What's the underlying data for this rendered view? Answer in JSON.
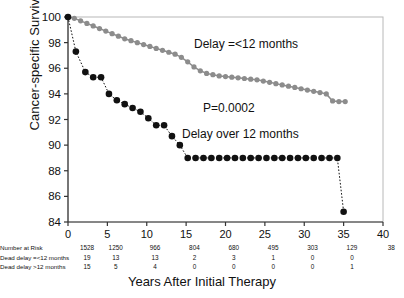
{
  "chart_data": {
    "type": "line",
    "title": "",
    "xlabel": "Years After Initial Therapy",
    "ylabel": "Cancer-specific Survival (%)",
    "xlim": [
      0,
      40
    ],
    "ylim": [
      84,
      100
    ],
    "xticks": [
      0,
      5,
      10,
      15,
      20,
      25,
      30,
      35,
      40
    ],
    "yticks": [
      84,
      86,
      88,
      90,
      92,
      94,
      96,
      98,
      100
    ],
    "grid": false,
    "legend_position": "inline-annotations",
    "annotations": [
      {
        "text": "Delay =<12 months",
        "x": 21.5,
        "y": 98.3
      },
      {
        "text": "P=0.0002",
        "x": 23.0,
        "y": 93.3
      },
      {
        "text": "Delay over 12 months",
        "x": 20.5,
        "y": 91.2
      }
    ],
    "series": [
      {
        "name": "Delay =<12 months",
        "color": "#8c8c8c",
        "marker": "circle",
        "x": [
          0.0,
          0.8,
          1.6,
          2.4,
          3.2,
          4.0,
          4.8,
          5.6,
          6.4,
          7.2,
          8.0,
          8.8,
          9.6,
          10.4,
          11.2,
          12.0,
          12.8,
          13.6,
          14.4,
          15.2,
          16.0,
          16.8,
          17.6,
          18.4,
          19.2,
          20.0,
          20.8,
          21.6,
          22.4,
          23.2,
          24.0,
          24.8,
          25.6,
          26.4,
          27.2,
          28.0,
          28.8,
          29.6,
          30.4,
          31.2,
          32.0,
          32.8,
          33.6,
          34.4,
          35.2
        ],
        "y": [
          100.0,
          99.9,
          99.7,
          99.5,
          99.3,
          99.1,
          98.9,
          98.7,
          98.5,
          98.3,
          98.15,
          98.0,
          97.85,
          97.7,
          97.55,
          97.4,
          97.25,
          97.1,
          96.85,
          96.5,
          96.1,
          95.8,
          95.6,
          95.5,
          95.4,
          95.35,
          95.3,
          95.25,
          95.2,
          95.15,
          95.1,
          95.0,
          94.9,
          94.8,
          94.7,
          94.6,
          94.5,
          94.4,
          94.3,
          94.2,
          94.1,
          94.0,
          93.45,
          93.4,
          93.4
        ]
      },
      {
        "name": "Delay over 12 months",
        "color": "#111111",
        "marker": "circle",
        "x": [
          0.0,
          1.0,
          2.2,
          3.2,
          4.2,
          5.2,
          6.2,
          7.2,
          8.2,
          9.2,
          10.2,
          11.2,
          12.2,
          13.2,
          14.2,
          15.2,
          16.2,
          17.2,
          18.2,
          19.2,
          20.2,
          21.2,
          22.2,
          23.2,
          24.2,
          25.2,
          26.2,
          27.2,
          28.2,
          29.2,
          30.2,
          31.2,
          32.2,
          33.2,
          34.2,
          35.0
        ],
        "y": [
          100.0,
          97.3,
          95.7,
          95.3,
          95.3,
          94.0,
          93.5,
          93.2,
          92.9,
          92.6,
          92.1,
          91.55,
          91.55,
          90.7,
          90.0,
          89.0,
          89.0,
          89.0,
          89.0,
          89.0,
          89.0,
          89.0,
          89.0,
          89.0,
          89.0,
          89.0,
          89.0,
          89.0,
          89.0,
          89.0,
          89.0,
          89.0,
          89.0,
          89.0,
          89.0,
          84.8
        ]
      }
    ],
    "risk_table": {
      "columns": [
        0,
        5,
        10,
        15,
        20,
        25,
        30,
        35,
        40
      ],
      "rows": [
        {
          "label": "Number at Risk",
          "values": [
            "1528",
            "1250",
            "966",
            "804",
            "680",
            "495",
            "303",
            "129",
            "38"
          ]
        },
        {
          "label": "Dead delay =<12 months",
          "values": [
            "19",
            "13",
            "13",
            "2",
            "3",
            "1",
            "0",
            "0",
            ""
          ]
        },
        {
          "label": "Dead delay >12 months",
          "values": [
            "15",
            "5",
            "4",
            "0",
            "0",
            "0",
            "0",
            "1",
            ""
          ]
        }
      ]
    }
  }
}
